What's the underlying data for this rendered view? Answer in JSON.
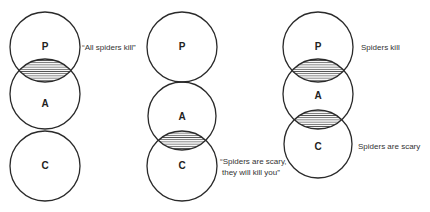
{
  "panels": [
    {
      "circles": [
        {
          "label": "P",
          "cx": 45,
          "cy": 47,
          "r": 35
        },
        {
          "label": "A",
          "cx": 45,
          "cy": 94,
          "r": 35
        },
        {
          "label": "C",
          "cx": 45,
          "cy": 166,
          "r": 35
        }
      ],
      "shaded_overlaps": [
        "P-A"
      ],
      "captions": [
        {
          "text": "“All spiders kill”",
          "x": 82,
          "y": 50
        }
      ]
    },
    {
      "circles": [
        {
          "label": "P",
          "cx": 182,
          "cy": 47,
          "r": 35
        },
        {
          "label": "A",
          "cx": 182,
          "cy": 116,
          "r": 34
        },
        {
          "label": "C",
          "cx": 182,
          "cy": 166,
          "r": 35
        }
      ],
      "shaded_overlaps": [
        "A-C"
      ],
      "captions": [
        {
          "text": "“Spiders are scary,",
          "x": 220,
          "y": 164
        },
        {
          "text": "they will kill you”",
          "x": 222,
          "y": 175
        }
      ]
    },
    {
      "circles": [
        {
          "label": "P",
          "cx": 318,
          "cy": 47,
          "r": 35
        },
        {
          "label": "A",
          "cx": 318,
          "cy": 94,
          "r": 35
        },
        {
          "label": "C",
          "cx": 318,
          "cy": 144,
          "r": 34
        }
      ],
      "shaded_overlaps": [
        "P-A",
        "A-C"
      ],
      "captions": [
        {
          "text": "Spiders kill",
          "x": 361,
          "y": 50
        },
        {
          "text": "Spiders are scary",
          "x": 358,
          "y": 149
        }
      ]
    }
  ],
  "labels": {
    "p1_P": "P",
    "p1_A": "A",
    "p1_C": "C",
    "p2_P": "P",
    "p2_A": "A",
    "p2_C": "C",
    "p3_P": "P",
    "p3_A": "A",
    "p3_C": "C",
    "p1_caption": "“All spiders kill”",
    "p2_caption_line1": "“Spiders are scary,",
    "p2_caption_line2": "they will kill you”",
    "p3_caption_top": "Spiders kill",
    "p3_caption_bottom": "Spiders are scary"
  },
  "colors": {
    "stroke": "#2a2a2a",
    "hatch": "#555555",
    "background": "#ffffff"
  }
}
